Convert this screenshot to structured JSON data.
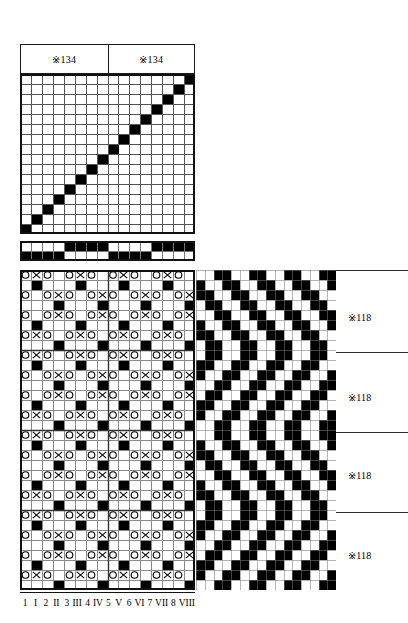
{
  "document": {
    "title": "Weaving draft — threading, tie-up and drawdown",
    "kind": "textile pattern draft"
  },
  "colors": {
    "ink": "#000000",
    "paper": "#ffffff",
    "grid_line": "#555555",
    "frame": "#111111"
  },
  "header": {
    "boxes": [
      {
        "label": "※134"
      },
      {
        "label": "※134"
      }
    ]
  },
  "threading": {
    "name": "threading-draft",
    "columns": 16,
    "rows": 16,
    "note": "single filled cell per column rising left-to-right (straight draw diagonal)",
    "filled_cells": [
      {
        "col": 0,
        "row": 15
      },
      {
        "col": 1,
        "row": 14
      },
      {
        "col": 2,
        "row": 13
      },
      {
        "col": 3,
        "row": 12
      },
      {
        "col": 4,
        "row": 11
      },
      {
        "col": 5,
        "row": 10
      },
      {
        "col": 6,
        "row": 9
      },
      {
        "col": 7,
        "row": 8
      },
      {
        "col": 8,
        "row": 7
      },
      {
        "col": 9,
        "row": 6
      },
      {
        "col": 10,
        "row": 5
      },
      {
        "col": 11,
        "row": 4
      },
      {
        "col": 12,
        "row": 3
      },
      {
        "col": 13,
        "row": 2
      },
      {
        "col": 14,
        "row": 1
      },
      {
        "col": 15,
        "row": 0
      }
    ]
  },
  "tieup_bar": {
    "name": "warp-colour-bar",
    "columns": 16,
    "rows": 2,
    "note": "1 = black, 0 = white",
    "grid": [
      [
        0,
        0,
        0,
        0,
        1,
        1,
        1,
        1,
        0,
        0,
        0,
        0,
        1,
        1,
        1,
        1
      ],
      [
        1,
        1,
        1,
        1,
        0,
        0,
        0,
        0,
        1,
        1,
        1,
        1,
        0,
        0,
        0,
        0
      ]
    ]
  },
  "drawdown": {
    "name": "drawdown-chart",
    "columns": 16,
    "rows": 32,
    "legend": {
      "circle": "O — warp-faced float marker",
      "cross": "X — crossing marker",
      "filled": "solid black square"
    },
    "note": "alternating marker rows (O / X) with solid squares on the in-between rows"
  },
  "weave_pattern": {
    "name": "woven-cloth-pattern",
    "columns": 16,
    "rows": 32,
    "note": "interlaced zig-zag twill blocks rendered black on white"
  },
  "repeat_labels": [
    {
      "label": "※118"
    },
    {
      "label": "※118"
    },
    {
      "label": "※118"
    },
    {
      "label": "※118"
    }
  ],
  "axis": {
    "name": "shaft-numbering",
    "labels": [
      "1",
      "I",
      "2",
      "II",
      "3",
      "III",
      "4",
      "IV",
      "5",
      "V",
      "6",
      "VI",
      "7",
      "VII",
      "8",
      "VIII"
    ]
  }
}
